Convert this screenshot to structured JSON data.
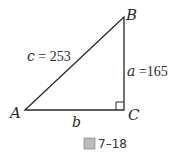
{
  "figure": {
    "vertices": {
      "A": {
        "label": "A",
        "x": 25,
        "y": 110
      },
      "B": {
        "label": "B",
        "x": 124,
        "y": 17
      },
      "C": {
        "label": "C",
        "x": 124,
        "y": 110
      }
    },
    "sides": {
      "c": {
        "var": "c",
        "eq": " = ",
        "value": "253"
      },
      "a": {
        "var": "a",
        "eq": " =",
        "value": "165"
      },
      "b": {
        "var": "b"
      }
    },
    "right_angle_at": "C",
    "caption": {
      "icon": "圖",
      "number": "7–18"
    },
    "colors": {
      "line": "#2a2a2a",
      "text": "#2a2a2a"
    }
  }
}
